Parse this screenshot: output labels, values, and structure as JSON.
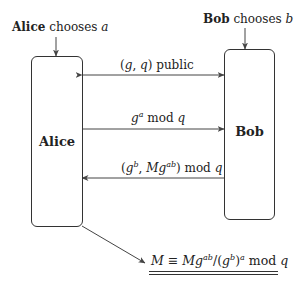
{
  "alice": {
    "name": "Alice",
    "chooses_text": "chooses",
    "secret": "a",
    "box_label": "Alice"
  },
  "bob": {
    "name": "Bob",
    "chooses_text": "chooses",
    "secret": "b",
    "box_label": "Bob"
  },
  "messages": [
    {
      "direction": "both",
      "parts": {
        "open": "(",
        "g": "g",
        "comma": ", ",
        "q": "q",
        "close": ")",
        "tail": " public"
      }
    },
    {
      "direction": "alice-to-bob",
      "parts": {
        "base": "g",
        "exp": "a",
        "mod": " mod ",
        "q": "q"
      }
    },
    {
      "direction": "bob-to-alice",
      "parts": {
        "open": "(",
        "g": "g",
        "exp_b": "b",
        "comma": ", ",
        "M": "M",
        "g2": "g",
        "exp_ab": "ab",
        "close": ")",
        "mod": " mod ",
        "q": "q"
      }
    }
  ],
  "result": {
    "lhs": "M",
    "equiv": " ≡ ",
    "M": "M",
    "g": "g",
    "exp_ab": "ab",
    "slash_open": "/(",
    "g2": "g",
    "exp_b": "b",
    "close": ")",
    "exp_a": "a",
    "mod": " mod ",
    "q": "q"
  }
}
